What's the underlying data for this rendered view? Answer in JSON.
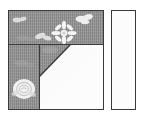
{
  "diagram": {
    "caption": "",
    "pieces": [
      {
        "id": "main-block",
        "name": "main pieced square",
        "shape": "square",
        "x": 8,
        "y": 10,
        "width": 96,
        "height": 100,
        "outline_color": "#3a3a3a"
      },
      {
        "id": "fabric-top-band",
        "name": "printed fabric top band",
        "shape": "rectangle",
        "fabric": "gray floral print",
        "fill_color": "#8f8f8f",
        "x": 0,
        "y": 0,
        "width": 94,
        "height": 33
      },
      {
        "id": "fabric-left-column",
        "name": "printed fabric left column",
        "shape": "rectangle",
        "fabric": "gray floral print",
        "fill_color": "#8f8f8f",
        "x": 0,
        "y": 33,
        "width": 30,
        "height": 65
      },
      {
        "id": "fabric-triangle",
        "name": "printed fabric corner triangle",
        "shape": "right triangle",
        "fabric": "gray floral print",
        "fill_color": "#8f8f8f",
        "x": 30,
        "y": 33,
        "width": 32,
        "height": 33
      },
      {
        "id": "white-lower-right",
        "name": "plain white lower right piece",
        "shape": "rectangle with clipped corner",
        "fabric": "plain white",
        "fill_color": "#fcfcfc",
        "x": 30,
        "y": 33,
        "width": 64,
        "height": 65
      },
      {
        "id": "side-strip",
        "name": "plain white side strip",
        "shape": "rectangle",
        "fabric": "plain white",
        "fill_color": "#fcfcfc",
        "x": 111,
        "y": 10,
        "width": 25,
        "height": 100,
        "outline_color": "#3a3a3a"
      }
    ],
    "seams": [
      {
        "id": "seam-horizontal",
        "name": "horizontal seam",
        "orientation": "horizontal",
        "color": "#3a3a3a"
      },
      {
        "id": "seam-vertical",
        "name": "vertical seam",
        "orientation": "vertical",
        "color": "#3a3a3a"
      },
      {
        "id": "seam-diagonal",
        "name": "diagonal seam",
        "orientation": "diagonal",
        "color": "#3a3a3a"
      }
    ],
    "motifs": [
      {
        "id": "motif-daisy-center",
        "name": "daisy flower motif",
        "color": "#f2f2f2"
      },
      {
        "id": "motif-rose-lower-left",
        "name": "rose flower motif",
        "color": "#f0f0f0"
      },
      {
        "id": "motif-blossom-top-right",
        "name": "blossom motif",
        "color": "#ededed"
      },
      {
        "id": "motif-blossom-top-left",
        "name": "small blossom motif",
        "color": "#e8e8e8"
      },
      {
        "id": "motif-leaf-upper",
        "name": "leaf motif",
        "color": "#e6e6e6"
      }
    ],
    "colors": {
      "print_fabric": "#8f8f8f",
      "plain_fabric": "#fcfcfc",
      "outline": "#3a3a3a",
      "background": "#ffffff"
    }
  }
}
